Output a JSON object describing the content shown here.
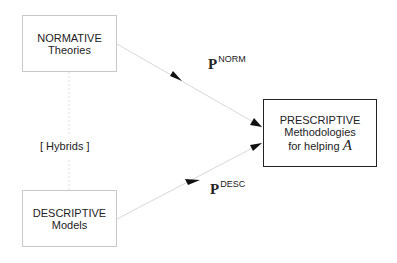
{
  "diagram": {
    "nodes": {
      "normative": {
        "line1": "NORMATIVE",
        "line2": "Theories"
      },
      "descriptive": {
        "line1": "DESCRIPTIVE",
        "line2": "Models"
      },
      "prescriptive": {
        "line1": "PRESCRIPTIVE",
        "line2": "Methodologies",
        "line3": "for helping",
        "symbol": "A"
      }
    },
    "hybrids_label": "[ Hybrids ]",
    "edges": {
      "p_norm": {
        "base": "P",
        "superscript": "NORM"
      },
      "p_desc": {
        "base": "P",
        "superscript": "DESC"
      }
    },
    "colors": {
      "light_line": "#d0d0d0",
      "dark_border": "#222222",
      "arrowhead": "#111111"
    }
  }
}
